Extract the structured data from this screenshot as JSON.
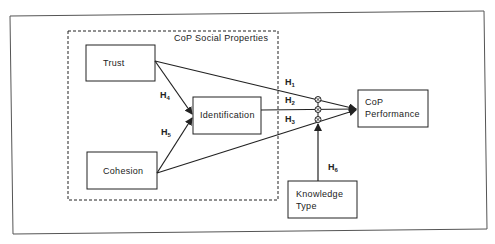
{
  "diagram": {
    "group": {
      "title": "CoP Social Properties"
    },
    "nodes": {
      "trust": "Trust",
      "cohesion": "Cohesion",
      "identification": "Identification",
      "performance_line1": "CoP",
      "performance_line2": "Performance",
      "knowledge_line1": "Knowledge",
      "knowledge_line2": "Type"
    },
    "hypotheses": {
      "h1": {
        "letter": "H",
        "sub": "1"
      },
      "h2": {
        "letter": "H",
        "sub": "2"
      },
      "h3": {
        "letter": "H",
        "sub": "3"
      },
      "h4": {
        "letter": "H",
        "sub": "4"
      },
      "h5": {
        "letter": "H",
        "sub": "5"
      },
      "h6": {
        "letter": "H",
        "sub": "6"
      }
    },
    "colors": {
      "line": "#222222",
      "frame": "#555555"
    }
  }
}
